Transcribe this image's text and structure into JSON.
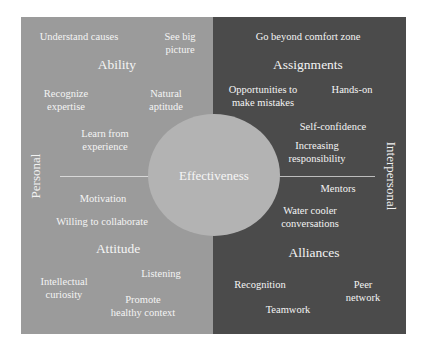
{
  "diagram": {
    "center": "Effectiveness",
    "axes": {
      "left": "Personal",
      "right": "Interpersonal"
    },
    "quadrants": {
      "ability": {
        "heading": "Ability",
        "items": [
          "Understand causes",
          "See big\npicture",
          "Recognize\nexpertise",
          "Natural\naptitude",
          "Learn from\nexperience"
        ]
      },
      "assignments": {
        "heading": "Assignments",
        "items": [
          "Go beyond comfort zone",
          "Opportunities to\nmake mistakes",
          "Hands-on",
          "Self-confidence",
          "Increasing\nresponsibility"
        ]
      },
      "attitude": {
        "heading": "Attitude",
        "items": [
          "Motivation",
          "Willing to collaborate",
          "Intellectual\ncuriosity",
          "Listening",
          "Promote\nhealthy context"
        ]
      },
      "alliances": {
        "heading": "Alliances",
        "items": [
          "Mentors",
          "Water cooler\nconversations",
          "Recognition",
          "Peer\nnetwork",
          "Teamwork"
        ]
      }
    },
    "colors": {
      "personal_panel": "#9b9b9b",
      "interpersonal_panel": "#4b4b4b",
      "circle": "#b3b3b3",
      "text": "#f4f4f4"
    }
  }
}
